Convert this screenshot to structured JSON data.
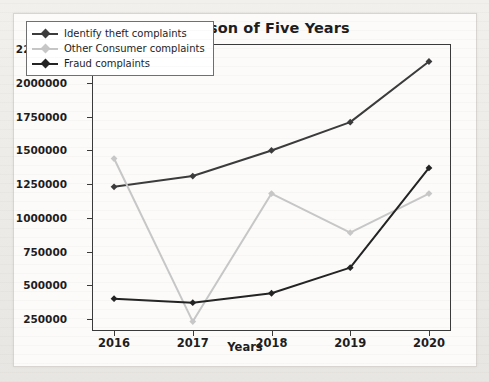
{
  "figure": {
    "title": "Comparison of Five Years",
    "xlabel": "Years"
  },
  "legend": {
    "items": [
      {
        "label": "Identify theft complaints",
        "color": "#3b3b3b"
      },
      {
        "label": "Other Consumer complaints",
        "color": "#c7c7c7"
      },
      {
        "label": "Fraud complaints",
        "color": "#232323"
      }
    ]
  },
  "axes": {
    "y_ticks": [
      "250000",
      "500000",
      "750000",
      "1000000",
      "1250000",
      "1500000",
      "1750000",
      "2000000",
      "2250000"
    ],
    "x_ticks": [
      "2016",
      "2017",
      "2018",
      "2019",
      "2020"
    ]
  },
  "chart_data": {
    "type": "line",
    "title": "Comparison of Five Years",
    "xlabel": "Years",
    "ylabel": "",
    "x": [
      2016,
      2017,
      2018,
      2019,
      2020
    ],
    "categories": [
      "2016",
      "2017",
      "2018",
      "2019",
      "2020"
    ],
    "series": [
      {
        "name": "Identify theft complaints",
        "color": "#3b3b3b",
        "values": [
          1230000,
          1310000,
          1500000,
          1710000,
          2160000
        ]
      },
      {
        "name": "Other Consumer complaints",
        "color": "#c7c7c7",
        "values": [
          1440000,
          230000,
          1180000,
          890000,
          1180000
        ]
      },
      {
        "name": "Fraud complaints",
        "color": "#232323",
        "values": [
          400000,
          370000,
          440000,
          630000,
          1370000
        ]
      }
    ],
    "ylim": [
      160000,
      2290000
    ],
    "xlim": [
      2015.72,
      2020.28
    ],
    "ytick_values": [
      250000,
      500000,
      750000,
      1000000,
      1250000,
      1500000,
      1750000,
      2000000,
      2250000
    ],
    "grid": false,
    "legend_position": "upper left",
    "marker": "diamond"
  }
}
